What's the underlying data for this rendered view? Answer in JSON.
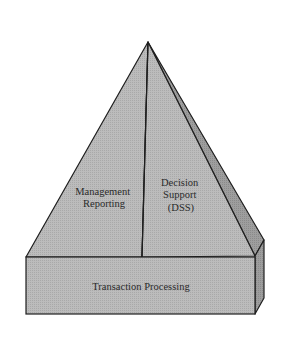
{
  "diagram": {
    "colors": {
      "face_front": "#b9b9b9",
      "face_side": "#9a9a9a",
      "outline": "#1e1e1e",
      "background": "#ffffff"
    },
    "layers": {
      "base": {
        "name": "transaction-processing",
        "label": "Transaction Processing"
      },
      "upper_left": {
        "name": "management-reporting",
        "lines": [
          "Management",
          "Reporting"
        ]
      },
      "upper_right": {
        "name": "decision-support",
        "lines": [
          "Decision",
          "Support",
          "(DSS)"
        ]
      }
    }
  }
}
